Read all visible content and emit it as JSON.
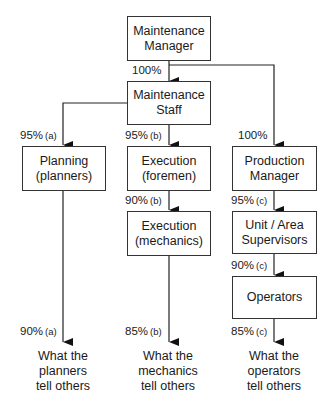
{
  "diagram": {
    "boxes": {
      "maintenance_manager": "Maintenance\nManager",
      "maintenance_staff": "Maintenance\nStaff",
      "planning": "Planning\n(planners)",
      "execution_foremen": "Execution\n(foremen)",
      "execution_mechanics": "Execution\n(mechanics)",
      "production_manager": "Production\nManager",
      "unit_supervisors": "Unit / Area\nSupervisors",
      "operators": "Operators"
    },
    "labels": {
      "mm_to_staff": {
        "value": "100%",
        "note": ""
      },
      "staff_to_planning": {
        "value": "95%",
        "note": "(a)"
      },
      "staff_to_foremen": {
        "value": "95%",
        "note": "(b)"
      },
      "foremen_to_mechanics": {
        "value": "90%",
        "note": "(b)"
      },
      "mm_to_production": {
        "value": "100%",
        "note": ""
      },
      "production_to_supervisors": {
        "value": "95%",
        "note": "(c)"
      },
      "supervisors_to_operators": {
        "value": "90%",
        "note": "(c)"
      },
      "planners_out": {
        "value": "90%",
        "note": "(a)"
      },
      "mechanics_out": {
        "value": "85%",
        "note": "(b)"
      },
      "operators_out": {
        "value": "85%",
        "note": "(c)"
      }
    },
    "outputs": {
      "planners": "What the\nplanners\ntell others",
      "mechanics": "What the\nmechanics\ntell others",
      "operators": "What the\noperators\ntell others"
    }
  }
}
